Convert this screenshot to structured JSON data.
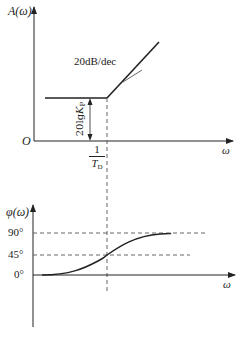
{
  "magnitude_plot": {
    "y_axis_label": "A(ω)",
    "x_axis_label": "ω",
    "origin_label": "O",
    "slope_label": "20dB/dec",
    "gain_label_main": "20lg",
    "gain_label_var": "K",
    "gain_label_sub": "P",
    "break_freq_numerator": "1",
    "break_freq_denominator": "T",
    "break_freq_sub": "D"
  },
  "phase_plot": {
    "y_axis_label": "φ(ω)",
    "x_axis_label": "ω",
    "tick_90": "90°",
    "tick_45": "45°",
    "tick_0": "0°"
  },
  "colors": {
    "line": "#222222",
    "dashed": "#555555",
    "background": "#ffffff"
  }
}
